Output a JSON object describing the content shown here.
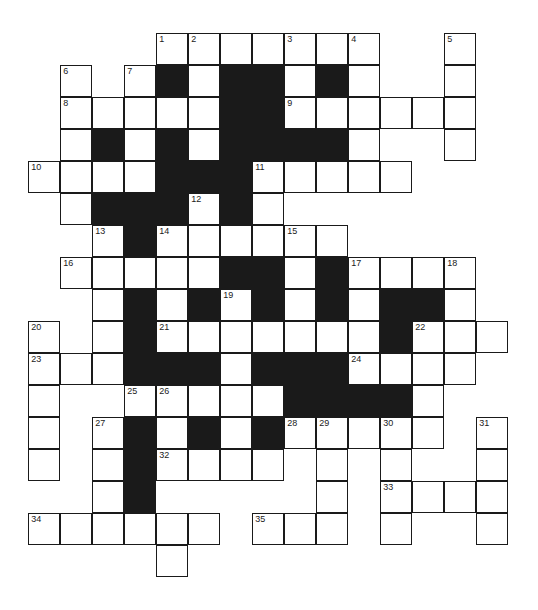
{
  "puzzle": {
    "type": "crossword",
    "cell_size": 32,
    "origin": {
      "x": 29,
      "y": 34
    },
    "colors": {
      "line": "#1a1a1a",
      "block": "#1a1a1a",
      "cell": "#ffffff"
    },
    "rows": [
      {
        "r": 0,
        "cells": [
          {
            "c": 4,
            "n": "1"
          },
          {
            "c": 5,
            "n": "2"
          },
          {
            "c": 6
          },
          {
            "c": 7
          },
          {
            "c": 8,
            "n": "3"
          },
          {
            "c": 9
          },
          {
            "c": 10,
            "n": "4"
          },
          {
            "c": 13,
            "n": "5"
          }
        ]
      },
      {
        "r": 1,
        "cells": [
          {
            "c": 1,
            "n": "6"
          },
          {
            "c": 3,
            "n": "7"
          },
          {
            "c": 4,
            "b": 1
          },
          {
            "c": 5
          },
          {
            "c": 6,
            "b": 1
          },
          {
            "c": 7,
            "b": 1
          },
          {
            "c": 8
          },
          {
            "c": 9,
            "b": 1
          },
          {
            "c": 10
          },
          {
            "c": 13
          }
        ]
      },
      {
        "r": 2,
        "cells": [
          {
            "c": 1,
            "n": "8"
          },
          {
            "c": 2
          },
          {
            "c": 3
          },
          {
            "c": 4
          },
          {
            "c": 5
          },
          {
            "c": 6,
            "b": 1
          },
          {
            "c": 7,
            "b": 1
          },
          {
            "c": 8,
            "n": "9"
          },
          {
            "c": 9
          },
          {
            "c": 10
          },
          {
            "c": 11
          },
          {
            "c": 12
          },
          {
            "c": 13
          }
        ]
      },
      {
        "r": 3,
        "cells": [
          {
            "c": 1
          },
          {
            "c": 2,
            "b": 1
          },
          {
            "c": 3
          },
          {
            "c": 4,
            "b": 1
          },
          {
            "c": 5
          },
          {
            "c": 6,
            "b": 1
          },
          {
            "c": 7,
            "b": 1
          },
          {
            "c": 8,
            "b": 1
          },
          {
            "c": 9,
            "b": 1
          },
          {
            "c": 10
          },
          {
            "c": 13
          }
        ]
      },
      {
        "r": 4,
        "cells": [
          {
            "c": 0,
            "n": "10"
          },
          {
            "c": 1
          },
          {
            "c": 2
          },
          {
            "c": 3
          },
          {
            "c": 4,
            "b": 1
          },
          {
            "c": 5,
            "b": 1
          },
          {
            "c": 6,
            "b": 1
          },
          {
            "c": 7,
            "n": "11"
          },
          {
            "c": 8
          },
          {
            "c": 9
          },
          {
            "c": 10
          },
          {
            "c": 11
          }
        ]
      },
      {
        "r": 5,
        "cells": [
          {
            "c": 1
          },
          {
            "c": 2,
            "b": 1
          },
          {
            "c": 3,
            "b": 1
          },
          {
            "c": 4,
            "b": 1
          },
          {
            "c": 5,
            "n": "12"
          },
          {
            "c": 6,
            "b": 1
          },
          {
            "c": 7
          }
        ]
      },
      {
        "r": 6,
        "cells": [
          {
            "c": 2,
            "n": "13"
          },
          {
            "c": 3,
            "b": 1
          },
          {
            "c": 4,
            "n": "14"
          },
          {
            "c": 5
          },
          {
            "c": 6
          },
          {
            "c": 7
          },
          {
            "c": 8,
            "n": "15"
          },
          {
            "c": 9
          }
        ]
      },
      {
        "r": 7,
        "cells": [
          {
            "c": 1,
            "n": "16"
          },
          {
            "c": 2
          },
          {
            "c": 3
          },
          {
            "c": 4
          },
          {
            "c": 5
          },
          {
            "c": 6,
            "b": 1
          },
          {
            "c": 7,
            "b": 1
          },
          {
            "c": 8
          },
          {
            "c": 9,
            "b": 1
          },
          {
            "c": 10,
            "n": "17"
          },
          {
            "c": 11
          },
          {
            "c": 12
          },
          {
            "c": 13,
            "n": "18"
          }
        ]
      },
      {
        "r": 8,
        "cells": [
          {
            "c": 2
          },
          {
            "c": 3,
            "b": 1
          },
          {
            "c": 4
          },
          {
            "c": 5,
            "b": 1
          },
          {
            "c": 6,
            "n": "19"
          },
          {
            "c": 7,
            "b": 1
          },
          {
            "c": 8
          },
          {
            "c": 9,
            "b": 1
          },
          {
            "c": 10
          },
          {
            "c": 11,
            "b": 1
          },
          {
            "c": 12,
            "b": 1
          },
          {
            "c": 13
          }
        ]
      },
      {
        "r": 9,
        "cells": [
          {
            "c": 0,
            "n": "20"
          },
          {
            "c": 2
          },
          {
            "c": 3,
            "b": 1
          },
          {
            "c": 4,
            "n": "21"
          },
          {
            "c": 5
          },
          {
            "c": 6
          },
          {
            "c": 7
          },
          {
            "c": 8
          },
          {
            "c": 9
          },
          {
            "c": 10
          },
          {
            "c": 11,
            "b": 1
          },
          {
            "c": 12,
            "n": "22"
          },
          {
            "c": 13
          },
          {
            "c": 14
          }
        ]
      },
      {
        "r": 10,
        "cells": [
          {
            "c": 0,
            "n": "23"
          },
          {
            "c": 1
          },
          {
            "c": 2
          },
          {
            "c": 3,
            "b": 1
          },
          {
            "c": 4,
            "b": 1
          },
          {
            "c": 5,
            "b": 1
          },
          {
            "c": 6
          },
          {
            "c": 7,
            "b": 1
          },
          {
            "c": 8,
            "b": 1
          },
          {
            "c": 9,
            "b": 1
          },
          {
            "c": 10,
            "n": "24"
          },
          {
            "c": 11
          },
          {
            "c": 12
          },
          {
            "c": 13
          }
        ]
      },
      {
        "r": 11,
        "cells": [
          {
            "c": 0
          },
          {
            "c": 3,
            "n": "25"
          },
          {
            "c": 4,
            "n": "26"
          },
          {
            "c": 5
          },
          {
            "c": 6
          },
          {
            "c": 7
          },
          {
            "c": 8,
            "b": 1
          },
          {
            "c": 9,
            "b": 1
          },
          {
            "c": 10,
            "b": 1
          },
          {
            "c": 11,
            "b": 1
          },
          {
            "c": 12
          }
        ]
      },
      {
        "r": 12,
        "cells": [
          {
            "c": 0
          },
          {
            "c": 2,
            "n": "27"
          },
          {
            "c": 3,
            "b": 1
          },
          {
            "c": 4
          },
          {
            "c": 5,
            "b": 1
          },
          {
            "c": 6
          },
          {
            "c": 7,
            "b": 1
          },
          {
            "c": 8,
            "n": "28"
          },
          {
            "c": 9,
            "n": "29"
          },
          {
            "c": 10
          },
          {
            "c": 11,
            "n": "30"
          },
          {
            "c": 12
          },
          {
            "c": 14,
            "n": "31"
          }
        ]
      },
      {
        "r": 13,
        "cells": [
          {
            "c": 0
          },
          {
            "c": 2
          },
          {
            "c": 3,
            "b": 1
          },
          {
            "c": 4,
            "n": "32"
          },
          {
            "c": 5
          },
          {
            "c": 6
          },
          {
            "c": 7
          },
          {
            "c": 9
          },
          {
            "c": 11
          },
          {
            "c": 14
          }
        ]
      },
      {
        "r": 14,
        "cells": [
          {
            "c": 2
          },
          {
            "c": 3,
            "b": 1
          },
          {
            "c": 9
          },
          {
            "c": 11,
            "n": "33"
          },
          {
            "c": 12
          },
          {
            "c": 13
          },
          {
            "c": 14
          }
        ]
      },
      {
        "r": 15,
        "cells": [
          {
            "c": 0,
            "n": "34"
          },
          {
            "c": 1
          },
          {
            "c": 2
          },
          {
            "c": 3
          },
          {
            "c": 4
          },
          {
            "c": 5
          },
          {
            "c": 7,
            "n": "35"
          },
          {
            "c": 8
          },
          {
            "c": 9
          },
          {
            "c": 11
          },
          {
            "c": 14
          }
        ]
      },
      {
        "r": 16,
        "cells": [
          {
            "c": 4
          }
        ]
      }
    ]
  }
}
